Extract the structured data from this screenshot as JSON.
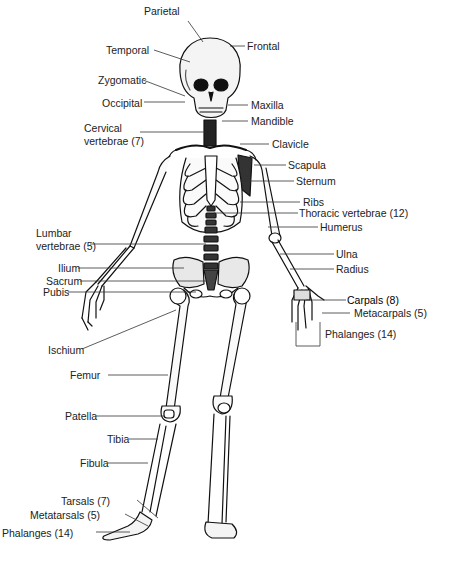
{
  "diagram": {
    "type": "anatomical-skeleton",
    "colors": {
      "ink": "#111111",
      "leader": "#333333",
      "background": "#ffffff",
      "text": "#222222"
    },
    "labels": {
      "parietal": "Parietal",
      "temporal": "Temporal",
      "zygomatic": "Zygomatic",
      "occipital": "Occipital",
      "frontal": "Frontal",
      "maxilla": "Maxilla",
      "mandible": "Mandible",
      "cervical_line1": "Cervical",
      "cervical_line2": "vertebrae (7)",
      "clavicle": "Clavicle",
      "scapula": "Scapula",
      "sternum": "Sternum",
      "ribs": "Ribs",
      "thoracic": "Thoracic vertebrae (12)",
      "humerus": "Humerus",
      "lumbar_line1": "Lumbar",
      "lumbar_line2": "vertebrae (5)",
      "ulna": "Ulna",
      "radius": "Radius",
      "ilium": "Ilium",
      "sacrum": "Sacrum",
      "pubis": "Pubis",
      "carpals": "Carpals (8)",
      "metacarpals": "Metacarpals (5)",
      "phalanges_hand": "Phalanges (14)",
      "ischium": "Ischium",
      "femur": "Femur",
      "patella": "Patella",
      "tibia": "Tibia",
      "fibula": "Fibula",
      "tarsals": "Tarsals (7)",
      "metatarsals": "Metatarsals (5)",
      "phalanges_foot": "Phalanges (14)"
    }
  }
}
